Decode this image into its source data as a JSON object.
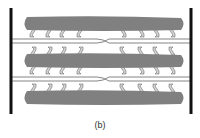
{
  "figure": {
    "caption": "(b)",
    "colors": {
      "z_line": "#111111",
      "thick_filament": "#808080",
      "crossbridge_fill": "#d4d4d4",
      "crossbridge_stroke": "#555555",
      "thin_filament": "#666666"
    },
    "z_lines": [
      {
        "name": "left-z-line",
        "x": 11,
        "y1": 8,
        "y2": 114
      },
      {
        "name": "right-z-line",
        "x": 191,
        "y1": 8,
        "y2": 114
      }
    ],
    "thick_filaments": [
      {
        "name": "thick-filament-top",
        "y": 17,
        "h": 13
      },
      {
        "name": "thick-filament-middle",
        "y": 54,
        "h": 13
      },
      {
        "name": "thick-filament-bottom",
        "y": 91,
        "h": 13
      }
    ],
    "thin_filament_pairs": [
      {
        "y1": 39,
        "y2": 43,
        "cross_x": 103
      },
      {
        "y1": 77,
        "y2": 81,
        "cross_x": 103
      }
    ],
    "crossbridge_x_left": [
      33,
      49,
      63,
      80
    ],
    "crossbridge_x_right": [
      123,
      141,
      156,
      172
    ]
  }
}
